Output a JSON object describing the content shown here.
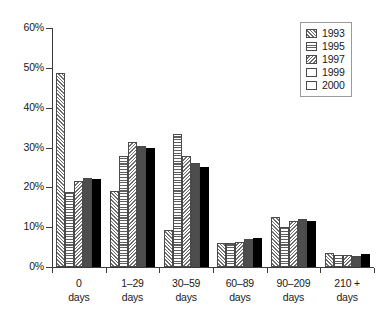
{
  "chart_data": {
    "type": "bar",
    "title": "",
    "xlabel": "",
    "ylabel": "",
    "ylim": [
      0,
      60
    ],
    "grid": false,
    "legend_position": "top-right",
    "categories": [
      "0\ndays",
      "1–29\ndays",
      "30–59\ndays",
      "60–89\ndays",
      "90–209\ndays",
      "210 +\ndays"
    ],
    "category_lines": [
      [
        "0",
        "days"
      ],
      [
        "1–29",
        "days"
      ],
      [
        "30–59",
        "days"
      ],
      [
        "60–89",
        "days"
      ],
      [
        "90–209",
        "days"
      ],
      [
        "210 +",
        "days"
      ]
    ],
    "ytick_labels": [
      "0%",
      "10%",
      "20%",
      "30%",
      "40%",
      "50%",
      "60%"
    ],
    "ytick_values": [
      0,
      10,
      20,
      30,
      40,
      50,
      60
    ],
    "series": [
      {
        "name": "1993",
        "pattern": "diagonal-forward-hatch",
        "values": [
          48.8,
          19.0,
          9.4,
          6.0,
          12.5,
          3.5
        ]
      },
      {
        "name": "1995",
        "pattern": "horizontal-lines",
        "values": [
          18.8,
          28.0,
          33.4,
          6.0,
          10.0,
          3.0
        ]
      },
      {
        "name": "1997",
        "pattern": "diagonal-backward-hatch",
        "values": [
          21.7,
          31.5,
          28.0,
          6.3,
          11.6,
          3.0
        ]
      },
      {
        "name": "1999",
        "pattern": "solid-dark-grey",
        "values": [
          22.4,
          30.5,
          26.0,
          7.0,
          12.0,
          2.8
        ]
      },
      {
        "name": "2000",
        "pattern": "solid-black",
        "values": [
          22.0,
          30.0,
          25.0,
          7.3,
          11.6,
          3.2
        ]
      }
    ]
  },
  "legend": {
    "items": [
      {
        "label": "1993"
      },
      {
        "label": "1995"
      },
      {
        "label": "1997"
      },
      {
        "label": "1999"
      },
      {
        "label": "2000"
      }
    ]
  },
  "colors": {
    "axis": "#3b3b3b",
    "bar_outline": "#4a4a4a",
    "series_1999": "#4d4d4d",
    "series_2000": "#000000",
    "background": "#ffffff",
    "legend_border": "#9a9a9a"
  }
}
